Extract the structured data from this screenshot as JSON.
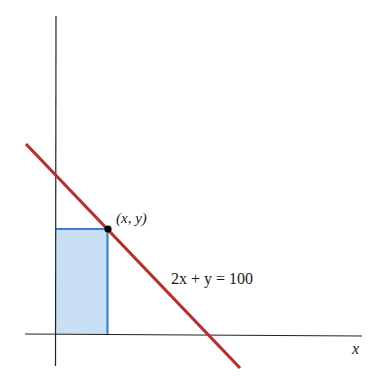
{
  "diagram": {
    "axes": {
      "x_label": "x",
      "color": "#222222"
    },
    "line": {
      "equation_label": "2x + y = 100",
      "color": "#b5302e"
    },
    "point": {
      "label": "(x, y)",
      "color": "#000000"
    },
    "rectangle": {
      "fill": "#c9dff3",
      "stroke": "#3b80d2"
    }
  }
}
